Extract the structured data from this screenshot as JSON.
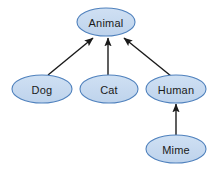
{
  "diagram": {
    "type": "inheritance-hierarchy",
    "background_color": "#ffffff",
    "node_fill_color": "#c6d9f0",
    "node_stroke_color": "#4f81bd",
    "node_text_color": "#1a1a1a",
    "edge_color": "#1a1a1a",
    "rule_color": "#95afc9",
    "nodes": [
      {
        "id": "animal",
        "label": "Animal",
        "cx": 106,
        "cy": 22,
        "rx": 29,
        "ry": 14
      },
      {
        "id": "dog",
        "label": "Dog",
        "cx": 42,
        "cy": 89,
        "rx": 30,
        "ry": 14
      },
      {
        "id": "cat",
        "label": "Cat",
        "cx": 109,
        "cy": 89,
        "rx": 29,
        "ry": 14
      },
      {
        "id": "human",
        "label": "Human",
        "cx": 176,
        "cy": 89,
        "rx": 30,
        "ry": 14
      },
      {
        "id": "mime",
        "label": "Mime",
        "cx": 176,
        "cy": 149,
        "rx": 30,
        "ry": 14
      }
    ],
    "edges": [
      {
        "id": "dog-animal",
        "from": "dog",
        "to": "animal",
        "x1": 48,
        "y1": 75,
        "x2": 93,
        "y2": 38
      },
      {
        "id": "cat-animal",
        "from": "cat",
        "to": "animal",
        "x1": 108,
        "y1": 75,
        "x2": 108,
        "y2": 38
      },
      {
        "id": "human-animal",
        "from": "human",
        "to": "animal",
        "x1": 171,
        "y1": 76,
        "x2": 124,
        "y2": 38
      },
      {
        "id": "mime-human",
        "from": "mime",
        "to": "human",
        "x1": 176,
        "y1": 135,
        "x2": 176,
        "y2": 104
      }
    ],
    "rule": {
      "id": "bottom-rule",
      "x1": 12,
      "y1": 172,
      "x2": 136,
      "y2": 172
    }
  }
}
